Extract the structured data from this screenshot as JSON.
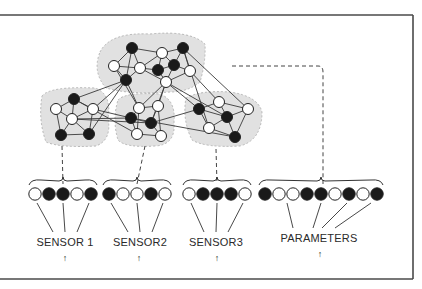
{
  "diagram": {
    "type": "network-to-input-encoding",
    "colors": {
      "frame": "#4a4a4a",
      "edge": "#3a3a3a",
      "node_filled": "#1a1a1a",
      "node_empty": "#ffffff",
      "cluster_fill": "#dcdcdc",
      "dashed": "#444444"
    },
    "groups": [
      {
        "id": "sensor1",
        "label": "SENSOR 1",
        "arrow": "↑",
        "label_x": 65,
        "nodes": [
          0,
          1,
          1,
          0,
          1
        ],
        "x0": 35
      },
      {
        "id": "sensor2",
        "label": "SENSOR2",
        "arrow": "↑",
        "label_x": 140,
        "nodes": [
          1,
          0,
          0,
          1,
          0
        ],
        "x0": 109
      },
      {
        "id": "sensor3",
        "label": "SENSOR3",
        "arrow": "↑",
        "label_x": 216,
        "nodes": [
          0,
          1,
          1,
          1,
          0
        ],
        "x0": 189
      },
      {
        "id": "parameters",
        "label": "PARAMETERS",
        "arrow": "↑",
        "label_x": 319,
        "nodes": [
          1,
          0,
          0,
          1,
          1,
          0,
          1,
          0,
          1
        ],
        "x0": 265
      }
    ],
    "network": {
      "nodes": [
        {
          "x": 132,
          "y": 48,
          "f": 1
        },
        {
          "x": 162,
          "y": 53,
          "f": 0
        },
        {
          "x": 183,
          "y": 48,
          "f": 1
        },
        {
          "x": 114,
          "y": 66,
          "f": 0
        },
        {
          "x": 140,
          "y": 68,
          "f": 0
        },
        {
          "x": 158,
          "y": 70,
          "f": 1
        },
        {
          "x": 174,
          "y": 65,
          "f": 1
        },
        {
          "x": 190,
          "y": 71,
          "f": 0
        },
        {
          "x": 126,
          "y": 80,
          "f": 1
        },
        {
          "x": 166,
          "y": 82,
          "f": 0
        },
        {
          "x": 74,
          "y": 99,
          "f": 1
        },
        {
          "x": 56,
          "y": 109,
          "f": 0
        },
        {
          "x": 93,
          "y": 109,
          "f": 0
        },
        {
          "x": 72,
          "y": 119,
          "f": 0
        },
        {
          "x": 139,
          "y": 108,
          "f": 0
        },
        {
          "x": 158,
          "y": 106,
          "f": 0
        },
        {
          "x": 131,
          "y": 118,
          "f": 1
        },
        {
          "x": 151,
          "y": 123,
          "f": 1
        },
        {
          "x": 199,
          "y": 109,
          "f": 1
        },
        {
          "x": 219,
          "y": 102,
          "f": 0
        },
        {
          "x": 227,
          "y": 117,
          "f": 1
        },
        {
          "x": 248,
          "y": 109,
          "f": 0
        },
        {
          "x": 61,
          "y": 135,
          "f": 1
        },
        {
          "x": 89,
          "y": 134,
          "f": 1
        },
        {
          "x": 137,
          "y": 134,
          "f": 0
        },
        {
          "x": 161,
          "y": 136,
          "f": 0
        },
        {
          "x": 209,
          "y": 128,
          "f": 0
        },
        {
          "x": 235,
          "y": 137,
          "f": 1
        }
      ],
      "edges": [
        [
          0,
          1
        ],
        [
          0,
          3
        ],
        [
          0,
          4
        ],
        [
          0,
          8
        ],
        [
          1,
          2
        ],
        [
          1,
          4
        ],
        [
          1,
          5
        ],
        [
          1,
          6
        ],
        [
          2,
          6
        ],
        [
          2,
          7
        ],
        [
          2,
          26
        ],
        [
          2,
          21
        ],
        [
          3,
          4
        ],
        [
          3,
          8
        ],
        [
          4,
          5
        ],
        [
          4,
          8
        ],
        [
          4,
          9
        ],
        [
          5,
          6
        ],
        [
          5,
          9
        ],
        [
          6,
          7
        ],
        [
          6,
          9
        ],
        [
          7,
          9
        ],
        [
          7,
          19
        ],
        [
          8,
          10
        ],
        [
          8,
          12
        ],
        [
          8,
          14
        ],
        [
          8,
          23
        ],
        [
          9,
          14
        ],
        [
          9,
          15
        ],
        [
          9,
          17
        ],
        [
          9,
          18
        ],
        [
          9,
          20
        ],
        [
          10,
          11
        ],
        [
          10,
          12
        ],
        [
          10,
          13
        ],
        [
          11,
          13
        ],
        [
          11,
          22
        ],
        [
          12,
          13
        ],
        [
          12,
          23
        ],
        [
          12,
          16
        ],
        [
          13,
          22
        ],
        [
          13,
          23
        ],
        [
          13,
          17
        ],
        [
          13,
          16
        ],
        [
          14,
          15
        ],
        [
          14,
          16
        ],
        [
          14,
          24
        ],
        [
          15,
          17
        ],
        [
          15,
          25
        ],
        [
          16,
          17
        ],
        [
          16,
          24
        ],
        [
          17,
          25
        ],
        [
          17,
          18
        ],
        [
          3,
          14
        ],
        [
          18,
          19
        ],
        [
          18,
          20
        ],
        [
          18,
          26
        ],
        [
          19,
          21
        ],
        [
          19,
          20
        ],
        [
          20,
          21
        ],
        [
          20,
          26
        ],
        [
          20,
          27
        ],
        [
          21,
          27
        ],
        [
          26,
          27
        ],
        [
          22,
          23
        ],
        [
          24,
          25
        ],
        [
          16,
          27
        ],
        [
          10,
          24
        ]
      ],
      "clusters": [
        "M100,52 Q110,32 150,34 Q190,30 205,44 Q206,62 200,82 Q188,92 170,92 Q130,95 106,88 Q92,72 100,52 Z",
        "M42,96 Q50,86 95,88 Q112,94 108,118 Q112,140 96,146 Q60,148 46,142 Q38,120 42,96 Z",
        "M118,100 Q125,92 160,94 Q176,100 174,122 Q176,145 155,146 Q125,148 118,140 Q112,120 118,100 Z",
        "M186,98 Q200,90 230,92 Q258,96 262,112 Q262,140 240,146 Q205,148 192,140 Q182,120 186,98 Z"
      ]
    },
    "connectors": [
      {
        "from": [
          62,
          146
        ],
        "to": [
          63,
          184
        ],
        "group": "sensor1"
      },
      {
        "from": [
          145,
          146
        ],
        "to": [
          137,
          184
        ],
        "group": "sensor2"
      },
      {
        "from": [
          216,
          149
        ],
        "to": [
          217,
          184
        ],
        "group": "sensor3"
      }
    ],
    "parameter_connector": {
      "path": "M232,66 L318,66 Q323,66 323,72 L323,184"
    }
  }
}
